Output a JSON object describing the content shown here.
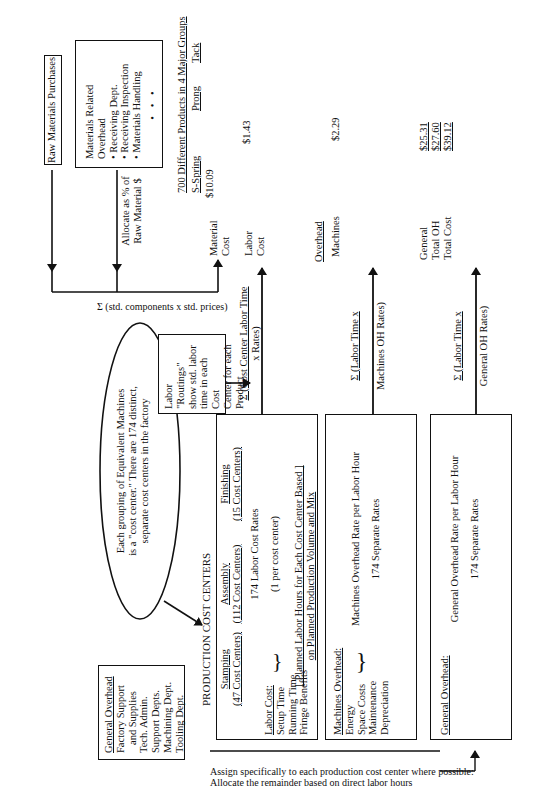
{
  "raw_materials": {
    "title": "Raw Materials Purchases"
  },
  "materials_overhead": {
    "title": "Materials Related Overhead",
    "items": [
      "• Receiving Dept.",
      "• Receiving Inspection",
      "• Materials Handling"
    ],
    "ellipsis": "• • •"
  },
  "allocate_label": {
    "line1": "Allocate as % of",
    "line2": "Raw Material $"
  },
  "sum_materials_label": "Σ (std. components x std. prices)",
  "products": {
    "heading": "700 Different Products in 4 Major Groups",
    "groups": [
      "S-Spring",
      "Prong",
      "Tack"
    ],
    "rows": [
      {
        "label": "Material Cost",
        "label_lines": [
          "Material",
          "Cost"
        ],
        "value": "$10.09"
      },
      {
        "label": "Labor Cost",
        "label_lines": [
          "Labor",
          "Cost"
        ],
        "value": "$1.43"
      },
      {
        "label": "Overhead",
        "label_lines": [
          "Overhead"
        ],
        "value": ""
      },
      {
        "label": "Machines",
        "label_lines": [
          "Machines"
        ],
        "value": "$2.29"
      }
    ],
    "totals": [
      {
        "label": "General",
        "value": "$25.31"
      },
      {
        "label": "Total OH",
        "value": "$27.60"
      },
      {
        "label": "Total Cost",
        "value": "$39.12"
      }
    ]
  },
  "labor_routings": {
    "lines": [
      "Labor \"Routings\"",
      "show std. labor",
      "time in each Cost",
      "Center for each",
      "Product"
    ]
  },
  "flows": {
    "labor": {
      "line1": "Σ (Cost Center Labor Time",
      "line2": "x Rates)"
    },
    "machines": {
      "line1": "Σ (Labor Time x",
      "line2": "Machines OH Rates)"
    },
    "general": {
      "line1": "Σ (Labor Time x",
      "line2": "General OH  Rates)"
    }
  },
  "ellipse_note": {
    "lines": [
      "Each grouping of Equivalent Machines",
      "is a \"cost center.\"  There are 174 distinct,",
      "separate cost centers in the factory"
    ]
  },
  "general_overhead_box": {
    "title": "General Overhead",
    "items": [
      "Factory Support",
      "and Supplies",
      "Tech. Admin.",
      "Support Depts.",
      "Machining Dept.",
      "Tooling Dept."
    ]
  },
  "production_cost_centers": {
    "title": "PRODUCTION COST CENTERS",
    "departments": [
      {
        "name": "Stamping",
        "count": "(47 Cost Centers)"
      },
      {
        "name": "Assembly",
        "count": "(112 Cost Centers)"
      },
      {
        "name": "Finishing",
        "count": "(15 Cost Centers)"
      }
    ],
    "labor_cost": {
      "title": "Labor Cost:",
      "items": [
        "Setup Time",
        "Running Time",
        "Fringe Benefits"
      ],
      "rate_line1": "174 Labor Cost Rates",
      "rate_line2": "(1 per cost center)",
      "planned_line1": "[  Planned Labor Hours for Each Cost Center Based   ]",
      "planned_line2": "on Planned Production Volume and Mix"
    }
  },
  "machines_overhead_box": {
    "title": "Machines Overhead:",
    "items": [
      "Energy",
      "Space Costs",
      "Maintenance",
      "Depreciation"
    ],
    "rate_line1": "Machines Overhead Rate per Labor Hour",
    "rate_line2": "174 Separate Rates"
  },
  "general_overhead_rate_box": {
    "title": "General Overhead:",
    "rate_line1": "General Overhead Rate per Labor Hour",
    "rate_line2": "174 Separate Rates"
  },
  "assign_note": {
    "line1": "Assign specifically to each production cost center where possible:",
    "line2": "Allocate the remainder based on direct labor hours"
  }
}
